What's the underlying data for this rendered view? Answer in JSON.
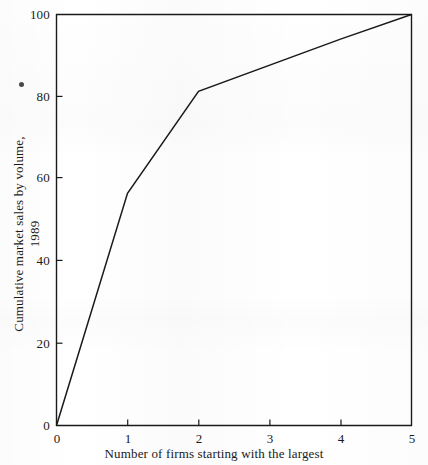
{
  "chart_data": {
    "type": "line",
    "title": "",
    "subtitle": "",
    "xlabel": "Number of firms starting with the largest",
    "ylabel": "Cumulative market sales by volume, 1989",
    "xlim": [
      0,
      5
    ],
    "ylim": [
      0,
      100
    ],
    "xticks": [
      0,
      1,
      2,
      3,
      4,
      5
    ],
    "yticks": [
      0,
      20,
      40,
      60,
      80,
      100
    ],
    "xtick_labels": [
      "0",
      "1",
      "2",
      "3",
      "4",
      "5"
    ],
    "ytick_labels": [
      "0",
      "20",
      "40",
      "60",
      "80",
      "100"
    ],
    "grid": false,
    "legend": null,
    "legend_position": "none",
    "annotations": [],
    "series": [
      {
        "name": "Cumulative market share",
        "color": "#1a1a1a",
        "x": [
          0,
          1,
          2,
          4,
          5
        ],
        "values": [
          0,
          56.5,
          81.3,
          94,
          100
        ],
        "points": [
          {
            "x": 0,
            "y": 0
          },
          {
            "x": 1,
            "y": 56.5
          },
          {
            "x": 2,
            "y": 81.3
          },
          {
            "x": 4,
            "y": 94
          },
          {
            "x": 5,
            "y": 100
          }
        ]
      }
    ]
  },
  "axes": {
    "x_title": "Number of firms starting with the largest",
    "y_title": "Cumulative market sales by volume, 1989",
    "x_tick_labels": [
      "0",
      "1",
      "2",
      "3",
      "4",
      "5"
    ],
    "y_tick_labels": [
      "0",
      "20",
      "40",
      "60",
      "80",
      "100"
    ],
    "frame_color": "#1a1a1a",
    "line_color": "#1a1a1a"
  },
  "artifacts": {
    "speck_label": "scan-speck"
  }
}
